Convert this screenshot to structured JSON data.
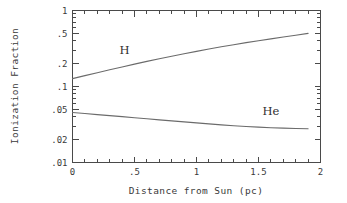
{
  "chart_data": {
    "type": "line",
    "title": "",
    "xlabel": "Distance from Sun (pc)",
    "ylabel": "Ionization Fraction",
    "xlim": [
      0,
      2
    ],
    "ylim": [
      0.01,
      1
    ],
    "yscale": "log",
    "xscale": "linear",
    "grid": false,
    "legend": "inline-labels",
    "xticks": [
      0,
      0.5,
      1,
      1.5,
      2
    ],
    "xticklabels": [
      "0",
      ".5",
      "1",
      "1.5",
      "2"
    ],
    "yticks": [
      1,
      0.5,
      0.2,
      0.1,
      0.05,
      0.02,
      0.01
    ],
    "yticklabels": [
      "1",
      ".5",
      ".2",
      ".1",
      ".05",
      ".02",
      ".01"
    ],
    "x": [
      0,
      0.1,
      0.2,
      0.3,
      0.4,
      0.5,
      0.6,
      0.7,
      0.8,
      0.9,
      1.0,
      1.1,
      1.2,
      1.3,
      1.4,
      1.5,
      1.6,
      1.7,
      1.8,
      1.9
    ],
    "series": [
      {
        "name": "H",
        "label": "H",
        "label_x": 0.42,
        "label_y": 0.27,
        "color": "#6b6b6b",
        "values": [
          0.127,
          0.139,
          0.152,
          0.166,
          0.181,
          0.197,
          0.214,
          0.232,
          0.25,
          0.27,
          0.29,
          0.311,
          0.333,
          0.355,
          0.378,
          0.4,
          0.423,
          0.447,
          0.472,
          0.5
        ]
      },
      {
        "name": "He",
        "label": "He",
        "label_x": 1.6,
        "label_y": 0.042,
        "color": "#6b6b6b",
        "values": [
          0.0455,
          0.0441,
          0.0427,
          0.0414,
          0.0401,
          0.0388,
          0.0376,
          0.0364,
          0.0353,
          0.0342,
          0.0332,
          0.0322,
          0.0313,
          0.0305,
          0.0298,
          0.0292,
          0.0287,
          0.0283,
          0.028,
          0.0278
        ]
      }
    ]
  },
  "figure": {
    "background": "#ffffff",
    "axis_color": "#4a4a4a",
    "text_color": "#3a3a3a"
  }
}
